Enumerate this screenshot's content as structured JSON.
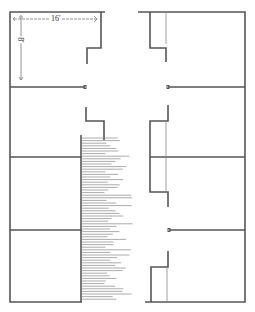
{
  "diagram": {
    "type": "floor-plan",
    "units_left": 4,
    "units_right": 4,
    "dimension_width_label": "16'",
    "dimension_depth_label": "8'",
    "colors": {
      "wall": "#555555",
      "line": "#777777",
      "hatch": "#888888",
      "background": "#ffffff"
    }
  }
}
